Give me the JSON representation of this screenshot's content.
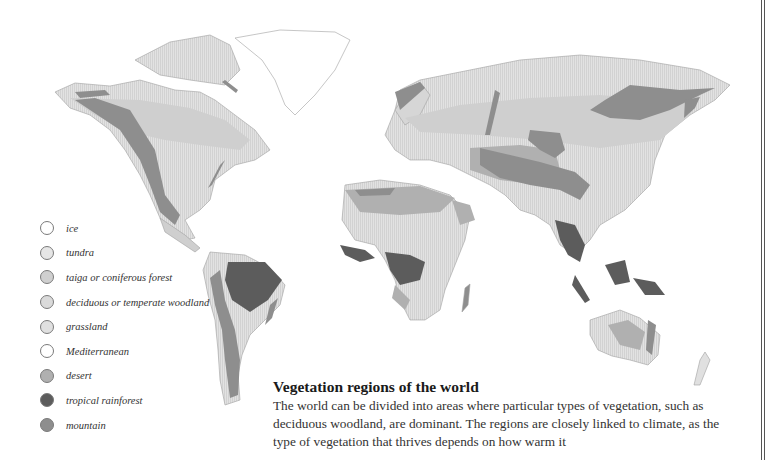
{
  "caption": {
    "title": "Vegetation regions of the world",
    "body": "The world can be divided into areas where particular types of vegetation, such as deciduous woodland, are dominant. The regions are closely linked to climate, as the type of vegetation that thrives depends on how warm it"
  },
  "legend": {
    "items": [
      {
        "key": "ice",
        "label": "ice",
        "color": "#ffffff"
      },
      {
        "key": "tundra",
        "label": "tundra",
        "color": "#e6e6e6"
      },
      {
        "key": "taiga",
        "label": "taiga or coniferous forest",
        "color": "#cfcfcf"
      },
      {
        "key": "deciduous",
        "label": "deciduous or temperate woodland",
        "color": "#dadada"
      },
      {
        "key": "grassland",
        "label": "grassland",
        "color": "#e0e0e0"
      },
      {
        "key": "mediterranean",
        "label": "Mediterranean",
        "color": "#ffffff"
      },
      {
        "key": "desert",
        "label": "desert",
        "color": "#b0b0b0"
      },
      {
        "key": "tropical_rainforest",
        "label": "tropical rainforest",
        "color": "#5c5c5c"
      },
      {
        "key": "mountain",
        "label": "mountain",
        "color": "#8e8e8e"
      }
    ]
  },
  "map": {
    "colors": {
      "ice": "#ffffff",
      "tundra": "#e6e6e6",
      "taiga": "#cfcfcf",
      "deciduous": "#dadada",
      "grassland": "#e0e0e0",
      "desert": "#b0b0b0",
      "rainforest": "#5c5c5c",
      "mountain": "#8e8e8e",
      "outline": "#9a9a9a"
    }
  }
}
